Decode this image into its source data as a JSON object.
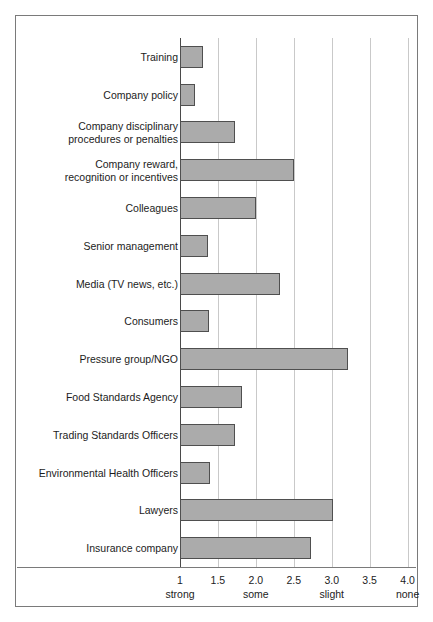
{
  "chart_data": {
    "type": "bar",
    "orientation": "horizontal",
    "title": "",
    "subtitle": "",
    "xlabel": "",
    "ylabel": "",
    "xlim": [
      1.0,
      4.15
    ],
    "grid": true,
    "legend": null,
    "bar_color": "#ababab",
    "bar_edge_color": "#4f4f4f",
    "categories": [
      "Training",
      "Company policy",
      "Company disciplinary\nprocedures or penalties",
      "Company reward,\nrecognition or incentives",
      "Colleagues",
      "Senior management",
      "Media (TV news, etc.)",
      "Consumers",
      "Pressure group/NGO",
      "Food Standards Agency",
      "Trading Standards Officers",
      "Environmental Health Officers",
      "Lawyers",
      "Insurance company"
    ],
    "values": [
      1.3,
      1.2,
      1.72,
      2.5,
      2.0,
      1.37,
      2.32,
      1.38,
      3.22,
      1.82,
      1.73,
      1.4,
      3.02,
      2.73
    ],
    "xticks": [
      1,
      1.5,
      2.0,
      2.5,
      3.0,
      3.5,
      4.0
    ],
    "xtick_labels": [
      "1",
      "1.5",
      "2.0",
      "2.5",
      "3.0",
      "3.5",
      "4.0"
    ],
    "xtick_words": [
      "strong",
      "",
      "some",
      "",
      "slight",
      "",
      "none"
    ]
  },
  "axis": {
    "scale_anchors": [
      {
        "value": 1,
        "label": "1",
        "word": "strong"
      },
      {
        "value": 1.5,
        "label": "1.5",
        "word": ""
      },
      {
        "value": 2.0,
        "label": "2.0",
        "word": "some"
      },
      {
        "value": 2.5,
        "label": "2.5",
        "word": ""
      },
      {
        "value": 3.0,
        "label": "3.0",
        "word": "slight"
      },
      {
        "value": 3.5,
        "label": "3.5",
        "word": ""
      },
      {
        "value": 4.0,
        "label": "4.0",
        "word": "none"
      }
    ]
  }
}
